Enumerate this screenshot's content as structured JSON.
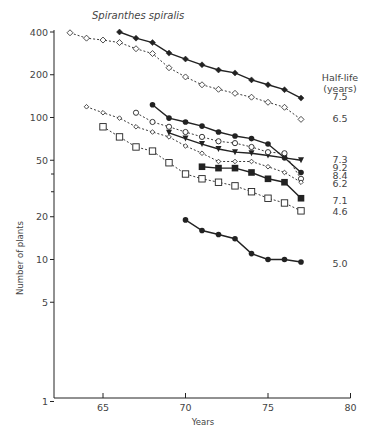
{
  "chart_data": {
    "type": "line",
    "title": "Spiranthes spiralis",
    "xlabel": "Years",
    "ylabel": "Number of plants",
    "yscale": "log",
    "xlim": [
      62,
      80
    ],
    "ylim": [
      1,
      400
    ],
    "xticks": [
      65,
      70,
      75,
      80
    ],
    "yticks": [
      1,
      5,
      10,
      20,
      50,
      100,
      200,
      400
    ],
    "yminor_ticks": [
      30,
      40
    ],
    "grid": false,
    "legend": {
      "title_line1": "Half-life",
      "title_line2": "(years)",
      "position": "right"
    },
    "series": [
      {
        "name": "7.5",
        "marker": "filled-diamond",
        "line": "solid",
        "x": [
          66,
          67,
          68,
          69,
          70,
          71,
          72,
          73,
          74,
          75,
          76,
          77
        ],
        "values": [
          400,
          362,
          337,
          284,
          258,
          235,
          216,
          206,
          184,
          170,
          157,
          137
        ]
      },
      {
        "name": "6.5",
        "marker": "open-diamond",
        "line": "dotted",
        "x": [
          63,
          64,
          65,
          66,
          67,
          68,
          69,
          70,
          71,
          72,
          73,
          74,
          75,
          76,
          77
        ],
        "values": [
          395,
          362,
          351,
          337,
          305,
          282,
          224,
          193,
          170,
          158,
          148,
          139,
          128,
          118,
          97
        ]
      },
      {
        "name": "7.3",
        "marker": "filled-triangle",
        "line": "solid",
        "x": [
          69,
          70,
          71,
          72,
          73,
          74,
          75,
          76,
          77
        ],
        "values": [
          78,
          71,
          65,
          60,
          57,
          56,
          54,
          52,
          50
        ]
      },
      {
        "name": "9.2",
        "marker": "filled-circle",
        "line": "solid",
        "x": [
          68,
          69,
          70,
          71,
          72,
          73,
          74,
          75,
          76,
          77
        ],
        "values": [
          123,
          99,
          93,
          87,
          79,
          74,
          71,
          65,
          52,
          41
        ]
      },
      {
        "name": "8.4",
        "marker": "open-circle",
        "line": "dotted",
        "x": [
          67,
          68,
          69,
          70,
          71,
          72,
          73,
          74,
          75,
          76,
          77
        ],
        "values": [
          108,
          93,
          86,
          79,
          73,
          68,
          66,
          62,
          57,
          56,
          37
        ]
      },
      {
        "name": "6.2",
        "marker": "small-open-diamond",
        "line": "dotted",
        "x": [
          64,
          65,
          66,
          67,
          68,
          69,
          70,
          71,
          72,
          73,
          74,
          75,
          76,
          77
        ],
        "values": [
          119,
          108,
          99,
          86,
          79,
          73,
          63,
          56,
          49,
          49,
          49,
          45,
          41,
          35
        ]
      },
      {
        "name": "7.1",
        "marker": "filled-square",
        "line": "solid",
        "x": [
          71,
          72,
          73,
          74,
          75,
          76,
          77
        ],
        "values": [
          45,
          44,
          44,
          41,
          37,
          35,
          27
        ]
      },
      {
        "name": "4.6",
        "marker": "open-square",
        "line": "dotted",
        "x": [
          65,
          66,
          67,
          68,
          69,
          70,
          71,
          72,
          73,
          74,
          75,
          76,
          77
        ],
        "values": [
          86,
          73,
          62,
          58,
          48,
          40,
          37,
          35,
          33,
          30,
          27,
          25,
          22
        ]
      },
      {
        "name": "5.0",
        "marker": "filled-circle",
        "line": "solid",
        "x": [
          70,
          71,
          72,
          73,
          74,
          75,
          76,
          77
        ],
        "values": [
          19,
          16,
          15,
          14,
          11,
          10,
          10,
          9.6
        ]
      }
    ],
    "half_life_labels": [
      {
        "text": "7.5",
        "y_px": 96
      },
      {
        "text": "6.5",
        "y_px": 118
      },
      {
        "text": "7.3",
        "y_px": 159
      },
      {
        "text": "9.2",
        "y_px": 167
      },
      {
        "text": "8.4",
        "y_px": 175
      },
      {
        "text": "6.2",
        "y_px": 183
      },
      {
        "text": "7.1",
        "y_px": 200
      },
      {
        "text": "4.6",
        "y_px": 211
      },
      {
        "text": "5.0",
        "y_px": 263
      }
    ]
  }
}
